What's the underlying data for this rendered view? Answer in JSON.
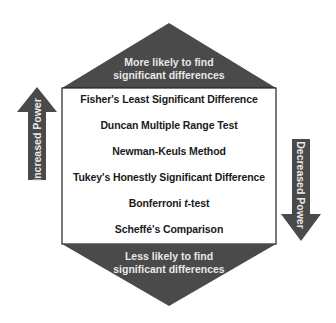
{
  "diagram": {
    "top_caption": [
      "More likely to find",
      "significant differences"
    ],
    "bottom_caption": [
      "Less likely to find",
      "significant differences"
    ],
    "methods": [
      {
        "label": "Fisher's Least Significant Difference"
      },
      {
        "label": "Duncan Multiple Range Test"
      },
      {
        "label": "Newman-Keuls Method"
      },
      {
        "label": "Tukey's Honestly Significant Difference"
      },
      {
        "label_prefix": "Bonferroni ",
        "label_italic": "t",
        "label_suffix": "-test"
      },
      {
        "label": "Scheffé's Comparison"
      }
    ],
    "left_arrow": {
      "label": "Increased Power",
      "direction": "up"
    },
    "right_arrow": {
      "label": "Decreased Power",
      "direction": "down"
    },
    "colors": {
      "dark": "#4a4a4a",
      "border": "#222222",
      "background": "#ffffff",
      "text_light": "#e8e8e8"
    }
  }
}
